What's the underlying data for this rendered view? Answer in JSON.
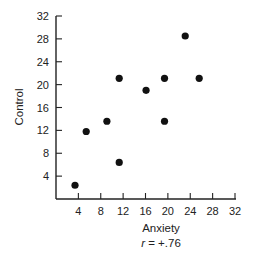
{
  "chart_data": {
    "type": "scatter",
    "title": "",
    "xlabel": "Anxiety",
    "ylabel": "Control",
    "annotation": "r = +.76",
    "annotation_parts": {
      "symbol": "r",
      "rest": " = +.76"
    },
    "xlim": [
      0,
      32
    ],
    "ylim": [
      0,
      32
    ],
    "xticks": [
      4,
      8,
      12,
      16,
      20,
      24,
      28,
      32
    ],
    "yticks": [
      4,
      8,
      12,
      16,
      20,
      24,
      28,
      32
    ],
    "grid": false,
    "legend": null,
    "points": [
      {
        "x": 3.4,
        "y": 2.4
      },
      {
        "x": 5.4,
        "y": 11.8
      },
      {
        "x": 9.1,
        "y": 13.6
      },
      {
        "x": 11.3,
        "y": 21.1
      },
      {
        "x": 11.3,
        "y": 6.4
      },
      {
        "x": 16.1,
        "y": 19.0
      },
      {
        "x": 19.4,
        "y": 21.1
      },
      {
        "x": 19.4,
        "y": 13.6
      },
      {
        "x": 23.1,
        "y": 28.5
      },
      {
        "x": 25.6,
        "y": 21.1
      }
    ],
    "marker_color": "#111111"
  }
}
